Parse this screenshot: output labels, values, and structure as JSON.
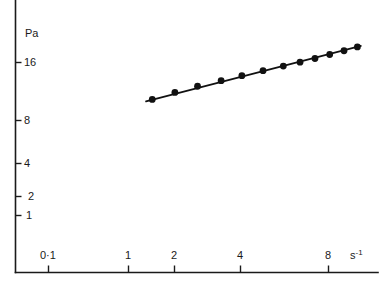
{
  "chart_data": {
    "type": "scatter",
    "title": "",
    "subtitle": "",
    "xlabel": "s⁻¹",
    "ylabel": "Pa",
    "xscale": "log",
    "yscale": "log",
    "grid": false,
    "legend": "none",
    "xlim": [
      0.07,
      11.5
    ],
    "ylim": [
      0.75,
      26
    ],
    "x_ticks": [
      {
        "value": 0.1,
        "label": "0·1"
      },
      {
        "value": 1,
        "label": "1"
      },
      {
        "value": 2,
        "label": "2"
      },
      {
        "value": 4,
        "label": "4"
      },
      {
        "value": 8,
        "label": "8"
      }
    ],
    "y_ticks": [
      {
        "value": 1,
        "label": "1"
      },
      {
        "value": 2,
        "label": "2"
      },
      {
        "value": 4,
        "label": "4"
      },
      {
        "value": 8,
        "label": "8"
      },
      {
        "value": 16,
        "label": "16"
      }
    ],
    "series": [
      {
        "name": "filled-circles",
        "marker": "filled-circle",
        "color": "#111111",
        "points": [
          {
            "x": 1.28,
            "y": 8.2
          },
          {
            "x": 1.62,
            "y": 9.3
          },
          {
            "x": 2.05,
            "y": 10.4
          },
          {
            "x": 2.62,
            "y": 11.5
          },
          {
            "x": 3.25,
            "y": 12.6
          },
          {
            "x": 4.05,
            "y": 13.8
          },
          {
            "x": 5.0,
            "y": 15.0
          },
          {
            "x": 5.95,
            "y": 16.1
          },
          {
            "x": 6.95,
            "y": 17.2
          },
          {
            "x": 8.1,
            "y": 18.5
          },
          {
            "x": 9.4,
            "y": 19.8
          },
          {
            "x": 10.8,
            "y": 21.2
          }
        ]
      },
      {
        "name": "cross-markers",
        "marker": "x",
        "color": "#111111",
        "points": [
          {
            "x": 0.074,
            "y": 1.05
          },
          {
            "x": 0.077,
            "y": 1.2
          },
          {
            "x": 0.08,
            "y": 1.38
          },
          {
            "x": 0.084,
            "y": 1.6
          },
          {
            "x": 0.088,
            "y": 1.8
          },
          {
            "x": 0.093,
            "y": 2.0
          },
          {
            "x": 0.098,
            "y": 2.25
          },
          {
            "x": 0.104,
            "y": 2.55
          },
          {
            "x": 0.11,
            "y": 2.85
          },
          {
            "x": 0.117,
            "y": 3.2
          },
          {
            "x": 0.124,
            "y": 3.55
          }
        ]
      }
    ],
    "fit_line": {
      "name": "regression-line",
      "from": {
        "x": 1.2,
        "y": 7.9
      },
      "to": {
        "x": 11.2,
        "y": 21.6
      }
    },
    "annotations": []
  }
}
